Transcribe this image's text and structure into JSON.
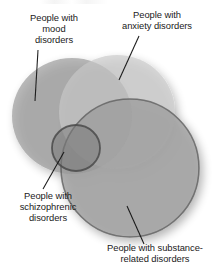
{
  "figure": {
    "width": 216,
    "height": 278,
    "background_color": "#ffffff",
    "kind": "venn-diagram"
  },
  "labels": {
    "mood": "People with\nmood\ndisorders",
    "anxiety": "People with\nanxiety disorders",
    "schizophrenic": "People with\nschizophrenic\ndisorders",
    "substance": "People with substance-\nrelated disorders"
  },
  "chart_data": {
    "type": "venn",
    "title": "",
    "sets": [
      {
        "id": "mood",
        "label": "People with mood disorders",
        "cx": 72,
        "cy": 116,
        "rx": 60,
        "ry": 58,
        "fill": "#8f8f8f",
        "opacity": 0.62,
        "stroke": "none"
      },
      {
        "id": "anxiety",
        "label": "People with anxiety disorders",
        "cx": 117,
        "cy": 112,
        "rx": 58,
        "ry": 57,
        "fill": "#c9c9c9",
        "opacity": 0.62,
        "stroke": "none"
      },
      {
        "id": "substance",
        "label": "People with substance-related disorders",
        "cx": 130,
        "cy": 168,
        "rx": 69,
        "ry": 69,
        "fill": "#9a9a9a",
        "opacity": 0.7,
        "stroke": "#5a5a5a",
        "stroke_width": 1.6
      },
      {
        "id": "schizophrenic",
        "label": "People with schizophrenic disorders",
        "cx": 76,
        "cy": 148,
        "rx": 24,
        "ry": 23,
        "fill": "#7c7c7c",
        "opacity": 0.55,
        "stroke": "#4a4a4a",
        "stroke_width": 1.8
      }
    ],
    "intersection_note": "All four sets overlap in a dark region near (74,142)",
    "leader_lines": [
      {
        "id": "mood-leader",
        "x1": 38,
        "y1": 50,
        "x2": 35,
        "y2": 101
      },
      {
        "id": "anxiety-leader",
        "x1": 139,
        "y1": 36,
        "x2": 119,
        "y2": 80
      },
      {
        "id": "schizophrenic-leader",
        "x1": 43,
        "y1": 189,
        "x2": 64,
        "y2": 152
      },
      {
        "id": "substance-leader",
        "x1": 144,
        "y1": 244,
        "x2": 127,
        "y2": 206
      }
    ],
    "legend": "none",
    "grid": false,
    "colors": {
      "mood": "#8f8f8f",
      "anxiety": "#c9c9c9",
      "substance": "#9a9a9a",
      "schizophrenic": "#7c7c7c",
      "text": "#1a1a1a",
      "leader_line": "#1a1a1a",
      "background": "#ffffff"
    }
  }
}
